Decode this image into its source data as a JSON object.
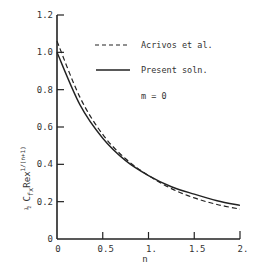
{
  "chart_data": {
    "type": "line",
    "title": "",
    "xlabel": "n",
    "ylabel": "1/2 C_fx Rex^(1/(n+1))",
    "xlim": [
      0,
      2
    ],
    "ylim": [
      0,
      1.2
    ],
    "grid": false,
    "x_ticks": [
      "0",
      "0.5",
      "1.",
      "1.5",
      "2."
    ],
    "y_ticks": [
      "0",
      "0.2",
      "0.4",
      "0.6",
      "0.8",
      "1.0",
      "1.2"
    ],
    "annotation": "m = 0",
    "legend_position": "upper right",
    "x": [
      0,
      0.25,
      0.5,
      0.75,
      1.0,
      1.25,
      1.5,
      1.75,
      2.0
    ],
    "series": [
      {
        "name": "Acrivos et al.",
        "style": "dashed",
        "values": [
          1.06,
          0.76,
          0.56,
          0.43,
          0.34,
          0.27,
          0.22,
          0.185,
          0.16
        ]
      },
      {
        "name": "Present soln.",
        "style": "solid",
        "values": [
          1.0,
          0.72,
          0.54,
          0.42,
          0.34,
          0.28,
          0.24,
          0.205,
          0.18
        ]
      }
    ]
  },
  "labels": {
    "x_axis": "n",
    "y_axis_frac": "1",
    "y_axis_frac_den": "2",
    "y_axis_main": "C",
    "y_axis_sub": "fx",
    "y_axis_re": "Rex",
    "y_axis_exp_num": "1",
    "y_axis_exp_den": "n+1",
    "annotation": "m = 0",
    "legend_dashed": "Acrivos et al.",
    "legend_solid": "Present soln."
  }
}
